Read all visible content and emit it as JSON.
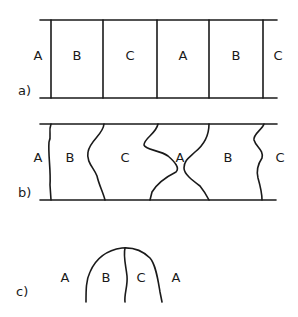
{
  "panels": {
    "a": {
      "label": "a)",
      "phases": [
        "A",
        "B",
        "C",
        "A",
        "B",
        "C"
      ]
    },
    "b": {
      "label": "b)",
      "phases": [
        "A",
        "B",
        "C",
        "A",
        "B",
        "C"
      ]
    },
    "c": {
      "label": "c)",
      "phases": [
        "A",
        "B",
        "C",
        "A"
      ]
    }
  }
}
